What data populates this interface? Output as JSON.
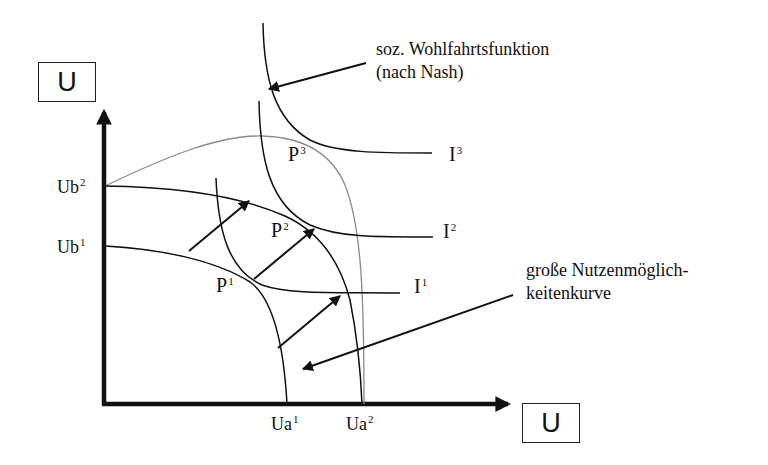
{
  "diagram": {
    "type": "welfare-economics-utility-possibility",
    "axes": {
      "y_axis_label": "U",
      "x_axis_label": "U"
    },
    "y_ticks": [
      {
        "base": "Ub",
        "sup": "2"
      },
      {
        "base": "Ub",
        "sup": "1"
      }
    ],
    "x_ticks": [
      {
        "base": "Ua",
        "sup": "1"
      },
      {
        "base": "Ua",
        "sup": "2"
      }
    ],
    "points": [
      {
        "base": "P",
        "sup": "1"
      },
      {
        "base": "P",
        "sup": "2"
      },
      {
        "base": "P",
        "sup": "3"
      }
    ],
    "indifference_curves": [
      {
        "base": "I",
        "sup": "1"
      },
      {
        "base": "I",
        "sup": "2"
      },
      {
        "base": "I",
        "sup": "3"
      }
    ],
    "annotations": {
      "welfare_function_line1": "soz. Wohlfahrtsfunktion",
      "welfare_function_line2": "(nach Nash)",
      "upc_line1": "große Nutzenmöglich-",
      "upc_line2": "keitenkurve"
    },
    "colors": {
      "ink": "#111111",
      "grand_upc": "#8a8a8a",
      "background": "#ffffff"
    }
  }
}
